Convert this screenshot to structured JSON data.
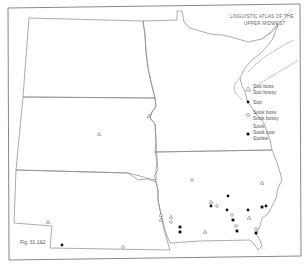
{
  "title": {
    "line1": "LINGUISTIC ATLAS OF THE",
    "line2": "UPPER MIDWEST"
  },
  "figure_label": "Fig. 31.1&2",
  "legend": {
    "items": [
      {
        "symbol": "triangle-icon",
        "line1": "Soo boss",
        "line2": "Soo bossy"
      },
      {
        "symbol": "dot-icon",
        "line1": "Soo",
        "line2": ""
      },
      {
        "symbol": "open-circle-icon",
        "line1": "Sook boss",
        "line2": "Sook bossy"
      },
      {
        "symbol": "square-icon",
        "line1": "Sook",
        "line2": "Sook cow",
        "line3": "Sookie"
      }
    ]
  },
  "states": [
    "North Dakota",
    "South Dakota",
    "Nebraska",
    "Minnesota",
    "Iowa"
  ],
  "points": [
    {
      "state": "South Dakota",
      "x": 99,
      "y": 134,
      "symbol": "triangle"
    },
    {
      "state": "South Dakota",
      "x": 149,
      "y": 116,
      "symbol": "triangle"
    },
    {
      "state": "Nebraska",
      "x": 48,
      "y": 222,
      "symbol": "triangle"
    },
    {
      "state": "Nebraska",
      "x": 62,
      "y": 245,
      "symbol": "dot"
    },
    {
      "state": "Nebraska",
      "x": 123,
      "y": 247,
      "symbol": "circle"
    },
    {
      "state": "Nebraska",
      "x": 161,
      "y": 215,
      "symbol": "triangle"
    },
    {
      "state": "Nebraska",
      "x": 161,
      "y": 220,
      "symbol": "triangle"
    },
    {
      "state": "Iowa",
      "x": 171,
      "y": 217,
      "symbol": "triangle"
    },
    {
      "state": "Iowa",
      "x": 171,
      "y": 222,
      "symbol": "circle"
    },
    {
      "state": "Iowa",
      "x": 180,
      "y": 227,
      "symbol": "square"
    },
    {
      "state": "Iowa",
      "x": 180,
      "y": 232,
      "symbol": "square"
    },
    {
      "state": "Iowa",
      "x": 205,
      "y": 232,
      "symbol": "triangle"
    },
    {
      "state": "Iowa",
      "x": 192,
      "y": 180,
      "symbol": "circle"
    },
    {
      "state": "Iowa",
      "x": 211,
      "y": 202,
      "symbol": "triangle"
    },
    {
      "state": "Iowa",
      "x": 211,
      "y": 206,
      "symbol": "dot"
    },
    {
      "state": "Iowa",
      "x": 217,
      "y": 206,
      "symbol": "circle"
    },
    {
      "state": "Iowa",
      "x": 228,
      "y": 196,
      "symbol": "dot"
    },
    {
      "state": "Iowa",
      "x": 227,
      "y": 210,
      "symbol": "dot"
    },
    {
      "state": "Iowa",
      "x": 232,
      "y": 215,
      "symbol": "circle"
    },
    {
      "state": "Iowa",
      "x": 233,
      "y": 220,
      "symbol": "square"
    },
    {
      "state": "Iowa",
      "x": 248,
      "y": 210,
      "symbol": "dot"
    },
    {
      "state": "Iowa",
      "x": 249,
      "y": 218,
      "symbol": "triangle"
    },
    {
      "state": "Iowa",
      "x": 236,
      "y": 226,
      "symbol": "circle"
    },
    {
      "state": "Iowa",
      "x": 237,
      "y": 231,
      "symbol": "square"
    },
    {
      "state": "Iowa",
      "x": 256,
      "y": 229,
      "symbol": "circle"
    },
    {
      "state": "Iowa",
      "x": 256,
      "y": 233,
      "symbol": "square"
    },
    {
      "state": "Iowa",
      "x": 266,
      "y": 206,
      "symbol": "dot"
    },
    {
      "state": "Iowa",
      "x": 262,
      "y": 183,
      "symbol": "triangle"
    },
    {
      "state": "Minnesota",
      "x": 262,
      "y": 207,
      "symbol": "square"
    }
  ]
}
